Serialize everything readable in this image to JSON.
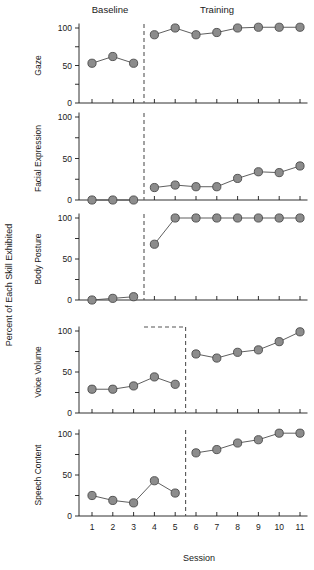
{
  "figure": {
    "phase_labels": [
      {
        "name": "Baseline",
        "x": 110
      },
      {
        "name": "Training",
        "x": 217
      }
    ],
    "y_axis_title": "Percent of Each Skill Exhibited",
    "x_axis_title": "Session",
    "y_ticks": [
      "0",
      "50",
      "100"
    ],
    "x_ticks": [
      "1",
      "2",
      "3",
      "4",
      "5",
      "6",
      "7",
      "8",
      "9",
      "10",
      "11"
    ],
    "marker_fill": "#8c8c8c",
    "marker_stroke": "#4a4a4a",
    "line_color": "#4d4d4d",
    "divider_color": "#555555"
  },
  "chart_data": {
    "type": "line",
    "title": "",
    "subtitle": "",
    "xlabel": "Session",
    "ylabel": "Percent of Each Skill Exhibited",
    "xlim": [
      0.5,
      11.5
    ],
    "ylim": [
      0,
      110
    ],
    "grid": false,
    "legend": "none",
    "x": [
      1,
      2,
      3,
      4,
      5,
      6,
      7,
      8,
      9,
      10,
      11
    ],
    "x_tick_labels": [
      "1",
      "2",
      "3",
      "4",
      "5",
      "6",
      "7",
      "8",
      "9",
      "10",
      "11"
    ],
    "y_tick_labels": [
      "0",
      "50",
      "100"
    ],
    "y_tick_values": [
      0,
      50,
      100
    ],
    "phase_annotations": [
      "Baseline",
      "Training"
    ],
    "panels": [
      {
        "name": "Gaze",
        "baseline_sessions": [
          1,
          2,
          3
        ],
        "training_sessions": [
          4,
          5,
          6,
          7,
          8,
          9,
          10,
          11
        ],
        "divider_after_session": 3,
        "series": [
          {
            "name": "Baseline",
            "x": [
              1,
              2,
              3
            ],
            "values": [
              53,
              62,
              53
            ]
          },
          {
            "name": "Training",
            "x": [
              4,
              5,
              6,
              7,
              8,
              9,
              10,
              11
            ],
            "values": [
              91,
              100,
              91,
              94,
              100,
              101,
              101,
              101
            ]
          }
        ]
      },
      {
        "name": "Facial Expression",
        "baseline_sessions": [
          1,
          2,
          3
        ],
        "training_sessions": [
          4,
          5,
          6,
          7,
          8,
          9,
          10,
          11
        ],
        "divider_after_session": 3,
        "series": [
          {
            "name": "Baseline",
            "x": [
              1,
              2,
              3
            ],
            "values": [
              0,
              0,
              0
            ]
          },
          {
            "name": "Training",
            "x": [
              4,
              5,
              6,
              7,
              8,
              9,
              10,
              11
            ],
            "values": [
              15,
              18,
              16,
              16,
              26,
              34,
              33,
              41
            ]
          }
        ]
      },
      {
        "name": "Body Posture",
        "baseline_sessions": [
          1,
          2,
          3
        ],
        "training_sessions": [
          4,
          5,
          6,
          7,
          8,
          9,
          10,
          11
        ],
        "divider_after_session": 3,
        "series": [
          {
            "name": "Baseline",
            "x": [
              1,
              2,
              3
            ],
            "values": [
              0,
              2,
              4
            ]
          },
          {
            "name": "Training",
            "x": [
              4,
              5,
              6,
              7,
              8,
              9,
              10,
              11
            ],
            "values": [
              68,
              100,
              100,
              100,
              100,
              100,
              100,
              100
            ]
          }
        ]
      },
      {
        "name": "Voice Volume",
        "baseline_sessions": [
          1,
          2,
          3,
          4,
          5
        ],
        "training_sessions": [
          6,
          7,
          8,
          9,
          10,
          11
        ],
        "divider_after_session": 5,
        "series": [
          {
            "name": "Baseline",
            "x": [
              1,
              2,
              3,
              4,
              5
            ],
            "values": [
              29,
              29,
              33,
              44,
              35
            ]
          },
          {
            "name": "Training",
            "x": [
              6,
              7,
              8,
              9,
              10,
              11
            ],
            "values": [
              72,
              67,
              74,
              77,
              87,
              99
            ]
          }
        ]
      },
      {
        "name": "Speech Content",
        "baseline_sessions": [
          1,
          2,
          3,
          4,
          5
        ],
        "training_sessions": [
          6,
          7,
          8,
          9,
          10,
          11
        ],
        "divider_after_session": 5,
        "series": [
          {
            "name": "Baseline",
            "x": [
              1,
              2,
              3,
              4,
              5
            ],
            "values": [
              25,
              19,
              16,
              43,
              28
            ]
          },
          {
            "name": "Training",
            "x": [
              6,
              7,
              8,
              9,
              10,
              11
            ],
            "values": [
              77,
              81,
              89,
              93,
              101,
              101
            ]
          }
        ]
      }
    ]
  }
}
